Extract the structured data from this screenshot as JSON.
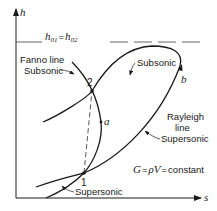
{
  "diagram": {
    "type": "h-s thermodynamic diagram",
    "axes": {
      "y_label": "h",
      "x_label": "s"
    },
    "stagnation_line": {
      "label_lhs": "h",
      "label_lhs_sub": "01",
      "equals": "=",
      "label_rhs": "h",
      "label_rhs_sub": "02",
      "style": "dashed"
    },
    "curves": {
      "fanno": {
        "label_line1": "Fanno line",
        "label_line2": "Subsonic"
      },
      "fanno_lower": {
        "label": "Supersonic"
      },
      "rayleigh_upper": {
        "label": "Subsonic"
      },
      "rayleigh": {
        "label_line1": "Rayleigh",
        "label_line2": "line",
        "label_line3": "Supersonic"
      }
    },
    "points": {
      "p1": "1",
      "p2": "2",
      "a": "a",
      "b": "b"
    },
    "equation": {
      "G": "G",
      "eq1": "=",
      "rho": "ρ",
      "V": "V",
      "eq2": "=",
      "constant": "constant"
    },
    "colors": {
      "line": "#1a1a1a",
      "dashed": "#555555",
      "background": "#ffffff"
    }
  }
}
